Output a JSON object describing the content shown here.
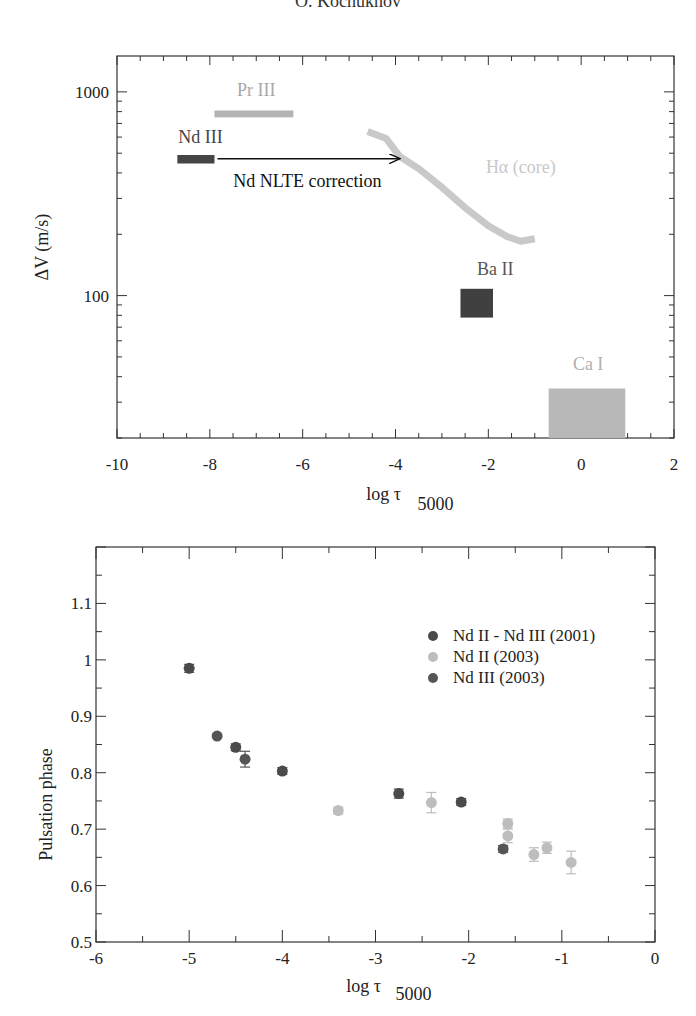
{
  "page": {
    "header": "O. Kochukhov"
  },
  "chart_data": [
    {
      "type": "bar",
      "id": "velocity-amplitude",
      "title": "",
      "xlabel": "log τ",
      "xlabel_sub": "5000",
      "ylabel": "ΔV (m/s)",
      "xlim": [
        -10,
        2
      ],
      "ylim": [
        20,
        1500
      ],
      "yscale": "log",
      "xticks": [
        -10,
        -8,
        -6,
        -4,
        -2,
        0,
        2
      ],
      "xtick_labels": [
        "-10",
        "-8",
        "-6",
        "-4",
        "-2",
        "0",
        "2"
      ],
      "yticks": [
        100,
        1000
      ],
      "ytick_labels": [
        "100",
        "1000"
      ],
      "grid": false,
      "regions": [
        {
          "name": "Pr III",
          "x": [
            -7.9,
            -6.2
          ],
          "y": [
            750,
            810
          ],
          "color": "#b3b3b3",
          "label_color": "#a8a8a8",
          "label_pos": [
            -7.0,
            950
          ]
        },
        {
          "name": "Nd III",
          "x": [
            -8.7,
            -7.9
          ],
          "y": [
            445,
            490
          ],
          "color": "#454545",
          "label_color": "#444444",
          "label_pos": [
            -8.2,
            560
          ]
        },
        {
          "name": "Ba II",
          "x": [
            -2.6,
            -1.9
          ],
          "y": [
            78,
            108
          ],
          "color": "#404040",
          "label_color": "#555555",
          "label_pos": [
            -1.85,
            126
          ]
        },
        {
          "name": "Ca I",
          "x": [
            -0.7,
            0.95
          ],
          "y": [
            20,
            35
          ],
          "color": "#b8b8b8",
          "label_color": "#b0b0b0",
          "label_pos": [
            0.15,
            43
          ]
        }
      ],
      "curves": [
        {
          "name": "Hα (core)",
          "color": "#c9c9c9",
          "label_color": "#c8c8c8",
          "label_pos": [
            -1.3,
            400
          ],
          "x": [
            -4.6,
            -4.2,
            -3.9,
            -3.5,
            -3.0,
            -2.5,
            -2.0,
            -1.6,
            -1.3,
            -1.0
          ],
          "y": [
            640,
            590,
            480,
            420,
            340,
            270,
            220,
            195,
            185,
            190
          ]
        }
      ],
      "annotations": [
        {
          "text": "Nd NLTE correction",
          "type": "arrow",
          "x_from": -7.9,
          "x_to": -3.9,
          "y": 470,
          "label_pos": [
            -5.9,
            340
          ]
        }
      ]
    },
    {
      "type": "scatter",
      "id": "pulsation-phase",
      "title": "",
      "xlabel": "log τ",
      "xlabel_sub": "5000",
      "ylabel": "Pulsation phase",
      "xlim": [
        -6,
        0
      ],
      "ylim": [
        0.5,
        1.2
      ],
      "xticks": [
        -6,
        -5,
        -4,
        -3,
        -2,
        -1,
        0
      ],
      "xtick_labels": [
        "-6",
        "-5",
        "-4",
        "-3",
        "-2",
        "-1",
        "0"
      ],
      "yticks": [
        0.5,
        0.6,
        0.7,
        0.8,
        0.9,
        1.0,
        1.1
      ],
      "ytick_labels": [
        "0.5",
        "0.6",
        "0.7",
        "0.8",
        "0.9",
        "1",
        "1.1"
      ],
      "grid": false,
      "legend_position": "top-right",
      "series": [
        {
          "name": "Nd II - Nd III  (2001)",
          "color": "#4a4a4a",
          "points": [
            {
              "x": -5.0,
              "y": 0.985,
              "err": 0.007
            },
            {
              "x": -4.5,
              "y": 0.845,
              "err": 0.006
            },
            {
              "x": -4.0,
              "y": 0.803,
              "err": 0.006
            },
            {
              "x": -2.75,
              "y": 0.763,
              "err": 0.008
            },
            {
              "x": -2.08,
              "y": 0.748,
              "err": 0.006
            }
          ]
        },
        {
          "name": "Nd II (2003)",
          "color": "#bdbdbd",
          "points": [
            {
              "x": -3.4,
              "y": 0.733,
              "err": 0.006
            },
            {
              "x": -2.4,
              "y": 0.747,
              "err": 0.018
            },
            {
              "x": -1.58,
              "y": 0.71,
              "err": 0.008
            },
            {
              "x": -1.58,
              "y": 0.688,
              "err": 0.012
            },
            {
              "x": -1.3,
              "y": 0.655,
              "err": 0.012
            },
            {
              "x": -1.16,
              "y": 0.667,
              "err": 0.01
            },
            {
              "x": -0.9,
              "y": 0.641,
              "err": 0.02
            }
          ]
        },
        {
          "name": "Nd III (2003)",
          "color": "#555555",
          "points": [
            {
              "x": -4.7,
              "y": 0.865,
              "err": 0.0
            },
            {
              "x": -4.4,
              "y": 0.824,
              "err": 0.014
            },
            {
              "x": -1.63,
              "y": 0.665,
              "err": 0.006
            }
          ]
        }
      ]
    }
  ]
}
